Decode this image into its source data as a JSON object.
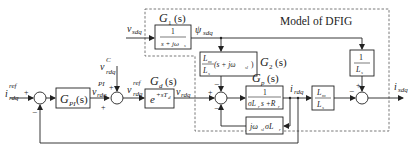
{
  "diagram": {
    "region_label": "Model of DFIG",
    "signals": {
      "i_ref": {
        "base": "i",
        "sub": "rdq",
        "sup": "ref"
      },
      "v_sdq": {
        "base": "v",
        "sub": "sdq"
      },
      "v_c": {
        "base": "v",
        "sub": "rdq",
        "sup": "C"
      },
      "v_pi": {
        "base": "v",
        "sub": "rdq",
        "sup": "PI"
      },
      "v_ref": {
        "base": "v",
        "sub": "rdq",
        "sup": "ref"
      },
      "v_rdq": {
        "base": "v",
        "sub": "rdq"
      },
      "psi_sdq": {
        "base": "ψ",
        "sub": "sdq"
      },
      "i_rdq": {
        "base": "i",
        "sub": "rdq"
      },
      "i_sdq": {
        "base": "i",
        "sub": "sdq"
      }
    },
    "blocks": {
      "gpi": {
        "label": "G",
        "sub": "PI",
        "arg": "(s)"
      },
      "g1": {
        "title": "G",
        "title_sub": "1",
        "title_arg": "(s)",
        "num": "1",
        "den": "s + jω",
        "den_sub": "s"
      },
      "gd": {
        "title": "G",
        "title_sub": "d",
        "title_arg": "(s)",
        "expr": "e",
        "exp": "+sT",
        "exp_sub": "d"
      },
      "g2": {
        "title": "G",
        "title_sub": "2",
        "title_arg": "(s)",
        "num": "L",
        "num_sub": "m",
        "den": "L",
        "den_sub": "s",
        "tail": "(s + jω",
        "tail_sub": "sl",
        "tail_end": ")"
      },
      "gp": {
        "title": "G",
        "title_sub": "p",
        "title_arg": "(s)",
        "num": "1",
        "den": "σL",
        "den_sub": "r",
        "den_tail": "s +R",
        "den_tail_sub": "r"
      },
      "cross": {
        "a": "jω",
        "a_sub": "sl",
        "b": " σL",
        "b_sub": "r"
      },
      "lm_ls": {
        "num": "L",
        "num_sub": "m",
        "den": "L",
        "den_sub": "s"
      },
      "inv_ls": {
        "num": "1",
        "den": "L",
        "den_sub": "s"
      }
    },
    "signs": {
      "plus": "+",
      "minus": "−"
    }
  }
}
